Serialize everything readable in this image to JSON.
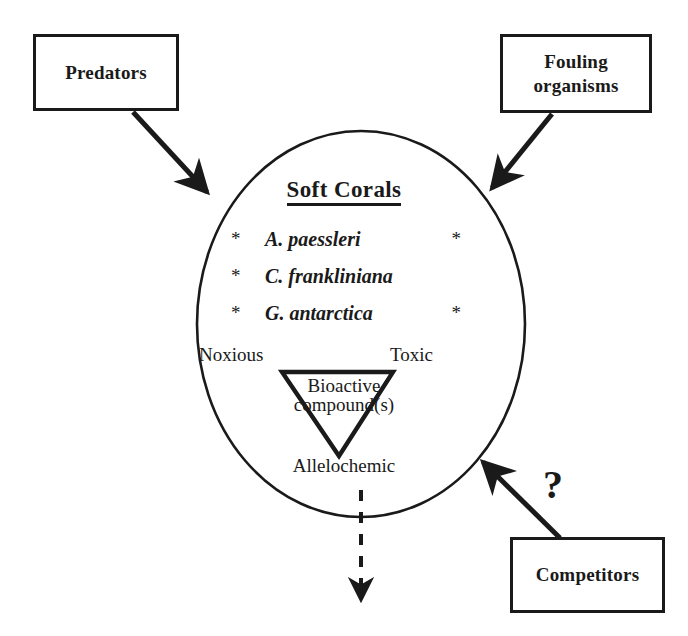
{
  "diagram": {
    "type": "concept-diagram",
    "title_text": "Soft Corals",
    "colors": {
      "stroke": "#1a1a1a",
      "background": "#ffffff",
      "text": "#1a1a1a"
    },
    "center": {
      "shape": "circle",
      "heading": "Soft Corals",
      "heading_underlined": true,
      "species": [
        {
          "bullet": "*",
          "name": "A. paessleri",
          "trailing_bullet": "*"
        },
        {
          "bullet": "*",
          "name": "C. frankliniana",
          "trailing_bullet": ""
        },
        {
          "bullet": "*",
          "name": "G. antarctica",
          "trailing_bullet": "*"
        }
      ],
      "triangle": {
        "shape": "inverted-triangle",
        "inner_label_line1": "Bioactive",
        "inner_label_line2": "compound(s)",
        "corner_top_left": "Noxious",
        "corner_top_right": "Toxic",
        "corner_bottom": "Allelochemic"
      }
    },
    "nodes": [
      {
        "id": "predators",
        "label": "Predators"
      },
      {
        "id": "fouling",
        "label_line1": "Fouling",
        "label_line2": "organisms"
      },
      {
        "id": "competitors",
        "label": "Competitors"
      }
    ],
    "annotations": {
      "uncertainty_marker": "?"
    },
    "arrows": [
      {
        "from": "predators",
        "to": "soft-corals-circle",
        "style": "solid",
        "direction": "inward"
      },
      {
        "from": "fouling",
        "to": "soft-corals-circle",
        "style": "solid",
        "direction": "inward"
      },
      {
        "from": "competitors",
        "to": "soft-corals-circle",
        "style": "solid",
        "direction": "inward",
        "marker": "?"
      },
      {
        "from": "soft-corals-circle",
        "to": "environment",
        "style": "dashed",
        "direction": "downward"
      }
    ]
  }
}
